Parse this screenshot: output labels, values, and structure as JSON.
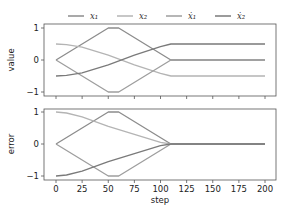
{
  "chart_data": [
    {
      "type": "line",
      "panel": "top",
      "title": "",
      "xlabel": "",
      "ylabel": "value",
      "xlim": [
        -6,
        210
      ],
      "ylim": [
        -1.1,
        1.1
      ],
      "yticks": [
        -1,
        0,
        1
      ],
      "xticks": [
        0,
        25,
        50,
        75,
        100,
        125,
        150,
        175,
        200
      ],
      "grid": false,
      "series": [
        {
          "name": "x1",
          "color": "#8c8c8c",
          "x": [
            0,
            50,
            60,
            110,
            200
          ],
          "y": [
            0,
            1,
            1,
            0,
            0
          ]
        },
        {
          "name": "x2",
          "color": "#b4b4b4",
          "x": [
            0,
            10,
            25,
            50,
            75,
            100,
            110,
            200
          ],
          "y": [
            0.5,
            0.48,
            0.4,
            0.15,
            -0.15,
            -0.42,
            -0.5,
            -0.5
          ]
        },
        {
          "name": "x1dot",
          "color": "#9e9e9e",
          "x": [
            0,
            50,
            60,
            110,
            200
          ],
          "y": [
            0,
            -1,
            -1,
            0,
            0
          ]
        },
        {
          "name": "x2dot",
          "color": "#7a7a7a",
          "x": [
            0,
            10,
            25,
            50,
            75,
            100,
            110,
            200
          ],
          "y": [
            -0.5,
            -0.48,
            -0.4,
            -0.15,
            0.15,
            0.42,
            0.5,
            0.5
          ]
        }
      ]
    },
    {
      "type": "line",
      "panel": "bottom",
      "title": "",
      "xlabel": "step",
      "ylabel": "error",
      "xlim": [
        -6,
        210
      ],
      "ylim": [
        -1.1,
        1.1
      ],
      "yticks": [
        -1,
        0,
        1
      ],
      "xticks": [
        0,
        25,
        50,
        75,
        100,
        125,
        150,
        175,
        200
      ],
      "grid": false,
      "series": [
        {
          "name": "x1",
          "color": "#8c8c8c",
          "x": [
            0,
            50,
            60,
            110,
            200
          ],
          "y": [
            0,
            1,
            1,
            0,
            0
          ]
        },
        {
          "name": "x2",
          "color": "#b4b4b4",
          "x": [
            0,
            10,
            25,
            50,
            75,
            100,
            110,
            200
          ],
          "y": [
            1,
            0.97,
            0.85,
            0.55,
            0.3,
            0.05,
            0,
            0
          ]
        },
        {
          "name": "x1dot",
          "color": "#9e9e9e",
          "x": [
            0,
            50,
            60,
            110,
            200
          ],
          "y": [
            0,
            -1,
            -1,
            0,
            0
          ]
        },
        {
          "name": "x2dot",
          "color": "#7a7a7a",
          "x": [
            0,
            10,
            25,
            50,
            75,
            100,
            110,
            200
          ],
          "y": [
            -1,
            -0.97,
            -0.85,
            -0.55,
            -0.3,
            -0.05,
            0,
            0
          ]
        }
      ]
    }
  ],
  "legend": {
    "position": "top-center",
    "entries": [
      {
        "label": "x₁",
        "color": "#8c8c8c"
      },
      {
        "label": "x₂",
        "color": "#b4b4b4"
      },
      {
        "label": "ẋ₁",
        "color": "#9e9e9e"
      },
      {
        "label": "ẋ₂",
        "color": "#7a7a7a"
      }
    ]
  },
  "axes": {
    "top": {
      "ylabel": "value",
      "ytick_labels": [
        "1",
        "0",
        "−1"
      ]
    },
    "bottom": {
      "ylabel": "error",
      "ytick_labels": [
        "1",
        "0",
        "−1"
      ],
      "xlabel": "step",
      "xtick_labels": [
        "0",
        "25",
        "50",
        "75",
        "100",
        "125",
        "150",
        "175",
        "200"
      ]
    }
  }
}
